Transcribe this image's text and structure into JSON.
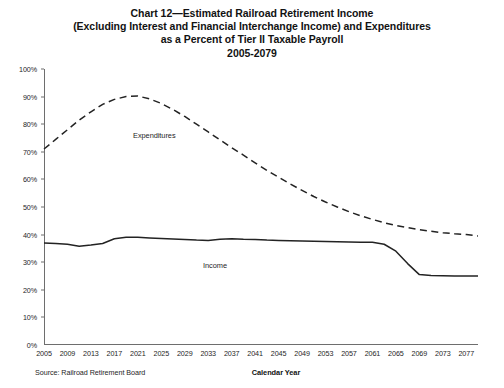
{
  "title": {
    "line1": "Chart 12—Estimated Railroad Retirement Income",
    "line2": "(Excluding Interest and Financial Interchange Income) and Expenditures",
    "line3": "as a Percent of Tier II Taxable Payroll",
    "line4": "2005-2079"
  },
  "footer": {
    "source": "Source: Railroad Retirement Board",
    "xaxis_title": "Calendar Year"
  },
  "annotations": {
    "expenditures": "Expenditures",
    "income": "Income"
  },
  "colors": {
    "line": "#232323",
    "axis": "#6e6e6e",
    "text": "#1e1e1e",
    "background": "#ffffff"
  },
  "chart_data": {
    "type": "line",
    "title": "Chart 12—Estimated Railroad Retirement Income (Excluding Interest and Financial Interchange Income) and Expenditures as a Percent of Tier II Taxable Payroll 2005-2079",
    "xlabel": "Calendar Year",
    "ylabel": "Percent of Tier II Taxable Payroll",
    "xlim": [
      2005,
      2079
    ],
    "ylim": [
      0,
      100
    ],
    "ytick_labels": [
      "0%",
      "10%",
      "20%",
      "30%",
      "40%",
      "50%",
      "60%",
      "70%",
      "80%",
      "90%",
      "100%"
    ],
    "ytick_values": [
      0,
      10,
      20,
      30,
      40,
      50,
      60,
      70,
      80,
      90,
      100
    ],
    "xtick_labels": [
      "2005",
      "2009",
      "2013",
      "2017",
      "2021",
      "2025",
      "2029",
      "2033",
      "2037",
      "2041",
      "2045",
      "2049",
      "2053",
      "2057",
      "2061",
      "2065",
      "2069",
      "2073",
      "2077"
    ],
    "xtick_values": [
      2005,
      2009,
      2013,
      2017,
      2021,
      2025,
      2029,
      2033,
      2037,
      2041,
      2045,
      2049,
      2053,
      2057,
      2061,
      2065,
      2069,
      2073,
      2077
    ],
    "grid": false,
    "legend": "inline-annotations",
    "x": [
      2005,
      2007,
      2009,
      2011,
      2013,
      2015,
      2017,
      2019,
      2021,
      2023,
      2025,
      2027,
      2029,
      2031,
      2033,
      2035,
      2037,
      2039,
      2041,
      2043,
      2045,
      2047,
      2049,
      2051,
      2053,
      2055,
      2057,
      2059,
      2061,
      2063,
      2065,
      2067,
      2069,
      2071,
      2073,
      2075,
      2077,
      2079
    ],
    "series": [
      {
        "name": "Expenditures",
        "style": "dashed",
        "values": [
          71.0,
          74.5,
          78.0,
          81.5,
          84.5,
          87.2,
          89.0,
          90.0,
          90.2,
          89.2,
          87.5,
          85.3,
          82.8,
          80.0,
          77.2,
          74.3,
          71.5,
          68.8,
          66.0,
          63.3,
          60.8,
          58.3,
          56.0,
          53.8,
          51.8,
          50.0,
          48.3,
          46.8,
          45.5,
          44.3,
          43.3,
          42.5,
          41.8,
          41.2,
          40.7,
          40.3,
          40.0,
          39.5
        ]
      },
      {
        "name": "Income",
        "style": "solid",
        "values": [
          37.0,
          36.8,
          36.5,
          35.8,
          36.2,
          36.8,
          38.5,
          39.0,
          39.0,
          38.8,
          38.6,
          38.4,
          38.2,
          38.0,
          37.9,
          38.3,
          38.5,
          38.3,
          38.2,
          38.0,
          37.9,
          37.8,
          37.7,
          37.6,
          37.5,
          37.4,
          37.3,
          37.2,
          37.2,
          36.5,
          34.0,
          29.5,
          25.5,
          25.2,
          25.1,
          25.0,
          25.0,
          25.0
        ]
      }
    ]
  }
}
